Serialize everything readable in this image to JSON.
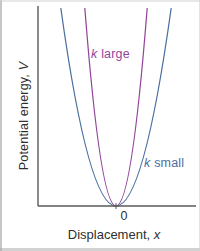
{
  "figure": {
    "background": "#ffffff",
    "axis_color": "#5a5a5a",
    "text_color": "#2f2f2f"
  },
  "chart_data": {
    "type": "line",
    "title": "",
    "xlabel": "Displacement, x",
    "ylabel": "Potential energy, V",
    "xlabel_parts": {
      "text": "Displacement, ",
      "symbol": "x"
    },
    "ylabel_parts": {
      "text": "Potential energy, ",
      "symbol": "V"
    },
    "origin_tick_label": "0",
    "axes": {
      "x_range_normalized": [
        -1,
        1
      ],
      "y_range_normalized": [
        0,
        1
      ],
      "x_tick_labels": [
        "0"
      ],
      "y_tick_labels": [],
      "grid": false
    },
    "legend_position": "inline annotations beside curves",
    "series": [
      {
        "name": "k large",
        "label_parts": {
          "symbol": "k",
          "text": " large"
        },
        "color": "#93459a",
        "stiffness_relative": 6.25,
        "x": [
          -0.4,
          -0.3,
          -0.2,
          -0.1,
          0,
          0.1,
          0.2,
          0.3,
          0.4
        ],
        "values": [
          1.0,
          0.56,
          0.25,
          0.06,
          0,
          0.06,
          0.25,
          0.56,
          1.0
        ]
      },
      {
        "name": "k small",
        "label_parts": {
          "symbol": "k",
          "text": " small"
        },
        "color": "#4a709f",
        "stiffness_relative": 2.0,
        "x": [
          -0.71,
          -0.5,
          -0.3,
          -0.1,
          0,
          0.1,
          0.3,
          0.5,
          0.71
        ],
        "values": [
          1.0,
          0.5,
          0.18,
          0.02,
          0,
          0.02,
          0.18,
          0.5,
          1.0
        ]
      }
    ]
  }
}
